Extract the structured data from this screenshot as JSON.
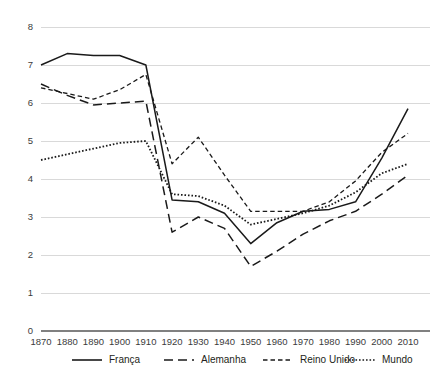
{
  "chart_data": {
    "type": "line",
    "title": "",
    "subtitle": "",
    "xlabel": "",
    "ylabel": "",
    "x": [
      1870,
      1880,
      1890,
      1900,
      1910,
      1920,
      1930,
      1940,
      1950,
      1960,
      1970,
      1980,
      1990,
      2000,
      2010
    ],
    "x_tick_labels": [
      "1870",
      "1880",
      "1890",
      "1900",
      "1910",
      "1920",
      "1930",
      "1940",
      "1950",
      "1960",
      "1970",
      "1980",
      "1990",
      "2000",
      "2010"
    ],
    "y_tick_labels": [
      "0",
      "1",
      "2",
      "3",
      "4",
      "5",
      "6",
      "7",
      "8"
    ],
    "y_ticks": [
      0,
      1,
      2,
      3,
      4,
      5,
      6,
      7,
      8
    ],
    "xlim": [
      1870,
      2010
    ],
    "ylim": [
      0,
      8
    ],
    "grid": "horizontal",
    "legend_position": "bottom",
    "series": [
      {
        "name": "França",
        "style": "solid",
        "color": "#1a1a1a",
        "values": [
          7.0,
          7.3,
          7.25,
          7.25,
          7.0,
          3.45,
          3.4,
          3.1,
          2.3,
          2.85,
          3.15,
          3.2,
          3.4,
          4.55,
          5.85
        ]
      },
      {
        "name": "Alemanha",
        "style": "long-dash",
        "color": "#1a1a1a",
        "values": [
          6.5,
          6.2,
          5.95,
          6.0,
          6.05,
          2.6,
          3.0,
          2.7,
          1.7,
          2.1,
          2.55,
          2.9,
          3.15,
          3.6,
          4.1
        ]
      },
      {
        "name": "Reino Unido",
        "style": "short-dash",
        "color": "#1a1a1a",
        "values": [
          6.4,
          6.25,
          6.1,
          6.35,
          6.75,
          4.4,
          5.1,
          4.1,
          3.15,
          3.15,
          3.15,
          3.4,
          3.95,
          4.7,
          5.2
        ]
      },
      {
        "name": "Mundo",
        "style": "dotted",
        "color": "#1a1a1a",
        "values": [
          4.5,
          4.65,
          4.8,
          4.95,
          5.0,
          3.6,
          3.55,
          3.3,
          2.8,
          2.95,
          3.1,
          3.3,
          3.65,
          4.15,
          4.4
        ]
      }
    ],
    "legend": [
      {
        "label": "França",
        "style": "solid"
      },
      {
        "label": "Alemanha",
        "style": "long-dash"
      },
      {
        "label": "Reino Unido",
        "style": "short-dash"
      },
      {
        "label": "Mundo",
        "style": "dotted"
      }
    ],
    "colors": {
      "line": "#1a1a1a",
      "grid": "#d9d9d9",
      "axis": "#808080",
      "text": "#231f20",
      "background": "#ffffff"
    }
  }
}
